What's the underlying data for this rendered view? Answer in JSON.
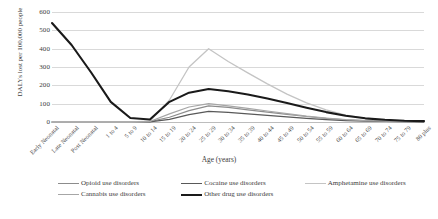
{
  "chart_data": {
    "type": "line",
    "title": "",
    "xlabel": "Age (years)",
    "ylabel": "DALYs lost per 100,000 people",
    "ylim": [
      0,
      600
    ],
    "ytick_labels": [
      "600",
      "500",
      "400",
      "300",
      "200",
      "100",
      "0"
    ],
    "ytick_values": [
      600,
      500,
      400,
      300,
      200,
      100,
      0
    ],
    "grid": "horizontal",
    "legend_position": "bottom",
    "categories": [
      "Early Neonatal",
      "Late Neonatal",
      "Post Neonatal",
      "1 to 4",
      "5 to 9",
      "10 to 14",
      "15 to 19",
      "20 to 24",
      "25 to 29",
      "30 to 34",
      "35 to 39",
      "40 to 44",
      "45 to 49",
      "50 to 54",
      "55 to 59",
      "60 to 64",
      "65 to 69",
      "70 to 74",
      "75 to 79",
      "80 plus"
    ],
    "series": [
      {
        "name": "Opioid use disorders",
        "color": "#8c8c8c",
        "width": 1.2,
        "values": [
          0,
          0,
          0,
          0,
          0,
          2,
          26,
          62,
          88,
          80,
          66,
          54,
          42,
          30,
          20,
          12,
          7,
          4,
          3,
          2
        ]
      },
      {
        "name": "Cocaine use disorders",
        "color": "#595959",
        "width": 1.2,
        "values": [
          0,
          0,
          0,
          0,
          0,
          1,
          14,
          40,
          58,
          52,
          44,
          36,
          28,
          20,
          13,
          8,
          5,
          3,
          2,
          1
        ]
      },
      {
        "name": "Amphetamine use disorders",
        "color": "#c4c4c4",
        "width": 1.3,
        "values": [
          0,
          0,
          0,
          0,
          0,
          4,
          120,
          300,
          400,
          330,
          268,
          208,
          152,
          104,
          66,
          38,
          20,
          11,
          6,
          4
        ]
      },
      {
        "name": "Cannabis use disorders",
        "color": "#a6a6a6",
        "width": 1.2,
        "values": [
          0,
          0,
          0,
          0,
          0,
          3,
          44,
          82,
          100,
          88,
          74,
          60,
          46,
          32,
          21,
          13,
          8,
          5,
          3,
          2
        ]
      },
      {
        "name": "Other drug use disorders",
        "color": "#1a1a1a",
        "width": 2.1,
        "values": [
          540,
          420,
          270,
          110,
          22,
          14,
          110,
          160,
          180,
          168,
          150,
          128,
          104,
          78,
          54,
          34,
          20,
          12,
          7,
          5
        ]
      }
    ]
  }
}
